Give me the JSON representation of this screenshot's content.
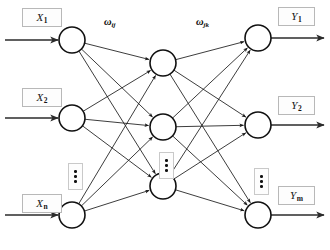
{
  "diagram": {
    "type": "neural-network",
    "background_color": "#ffffff",
    "stroke_color": "#111111",
    "layers": [
      {
        "name": "input-layer",
        "node_count_shown": 3,
        "x": 72,
        "node_radius": 13,
        "nodes": [
          {
            "id": "input-1",
            "label": "X",
            "subscript": "1",
            "y": 40
          },
          {
            "id": "input-2",
            "label": "X",
            "subscript": "2",
            "y": 118
          },
          {
            "id": "input-n",
            "label": "X",
            "subscript": "n",
            "y": 215
          }
        ],
        "ellipsis": {
          "x": 68,
          "y": 163,
          "glyph": "vertical-ellipsis"
        }
      },
      {
        "name": "hidden-layer",
        "node_count_shown": 3,
        "x": 163,
        "node_radius": 13,
        "nodes": [
          {
            "id": "hidden-1",
            "label": "",
            "subscript": "",
            "y": 63
          },
          {
            "id": "hidden-2",
            "label": "",
            "subscript": "",
            "y": 127
          },
          {
            "id": "hidden-3",
            "label": "",
            "subscript": "",
            "y": 186
          }
        ],
        "ellipsis": {
          "x": 159,
          "y": 152,
          "glyph": "vertical-ellipsis"
        }
      },
      {
        "name": "output-layer",
        "node_count_shown": 3,
        "x": 258,
        "node_radius": 13,
        "nodes": [
          {
            "id": "output-1",
            "label": "Y",
            "subscript": "1",
            "y": 38
          },
          {
            "id": "output-2",
            "label": "Y",
            "subscript": "2",
            "y": 125
          },
          {
            "id": "output-m",
            "label": "Y",
            "subscript": "m",
            "y": 215
          }
        ],
        "ellipsis": {
          "x": 254,
          "y": 168,
          "glyph": "vertical-ellipsis"
        }
      }
    ],
    "weight_labels": [
      {
        "id": "weight-input-hidden",
        "symbol": "ω",
        "subscript": "ij",
        "x": 104,
        "y": 17
      },
      {
        "id": "weight-hidden-output",
        "symbol": "ω",
        "subscript": "jk",
        "x": 196,
        "y": 17
      }
    ],
    "input_arrows": [
      {
        "id": "input-arrow-1",
        "y": 40
      },
      {
        "id": "input-arrow-2",
        "y": 118
      },
      {
        "id": "input-arrow-n",
        "y": 215
      }
    ],
    "output_arrows": [
      {
        "id": "output-arrow-1",
        "y": 38
      },
      {
        "id": "output-arrow-2",
        "y": 125
      },
      {
        "id": "output-arrow-m",
        "y": 215
      }
    ],
    "label_boxes": [
      {
        "id": "label-box-x1",
        "text_main": "X",
        "text_sub": "1",
        "x": 22,
        "y": 8,
        "w": 40,
        "h": 19
      },
      {
        "id": "label-box-x2",
        "text_main": "X",
        "text_sub": "2",
        "x": 22,
        "y": 88,
        "w": 40,
        "h": 19
      },
      {
        "id": "label-box-xn",
        "text_main": "X",
        "text_sub": "n",
        "x": 22,
        "y": 194,
        "w": 40,
        "h": 19
      },
      {
        "id": "label-box-y1",
        "text_main": "Y",
        "text_sub": "1",
        "x": 278,
        "y": 7,
        "w": 37,
        "h": 19
      },
      {
        "id": "label-box-y2",
        "text_main": "Y",
        "text_sub": "2",
        "x": 278,
        "y": 96,
        "w": 37,
        "h": 19
      },
      {
        "id": "label-box-ym",
        "text_main": "Y",
        "text_sub": "m",
        "x": 278,
        "y": 186,
        "w": 37,
        "h": 19
      }
    ]
  }
}
